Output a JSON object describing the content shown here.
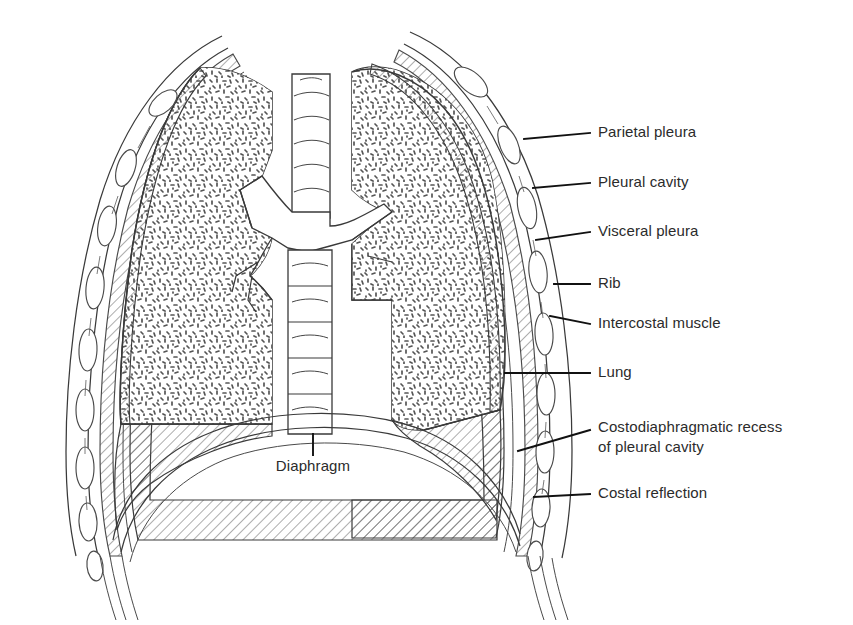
{
  "figure": {
    "background_color": "#ffffff",
    "ink_color": "#3a3a3a",
    "text_color": "#2b2b2b",
    "width": 853,
    "height": 625
  },
  "labels": [
    {
      "id": "parietal-pleura",
      "text": "Parietal pleura",
      "text_x": 598,
      "text_y": 133,
      "leader": {
        "x1": 524,
        "y1": 139,
        "x2": 590,
        "y2": 133
      }
    },
    {
      "id": "pleural-cavity",
      "text": "Pleural cavity",
      "text_x": 598,
      "text_y": 183,
      "leader": {
        "x1": 533,
        "y1": 188,
        "x2": 590,
        "y2": 183
      }
    },
    {
      "id": "visceral-pleura",
      "text": "Visceral pleura",
      "text_x": 598,
      "text_y": 232,
      "leader": {
        "x1": 536,
        "y1": 240,
        "x2": 590,
        "y2": 232
      }
    },
    {
      "id": "rib",
      "text": "Rib",
      "text_x": 598,
      "text_y": 284,
      "leader": {
        "x1": 554,
        "y1": 284,
        "x2": 590,
        "y2": 284
      }
    },
    {
      "id": "intercostal-muscle",
      "text": "Intercostal muscle",
      "text_x": 598,
      "text_y": 324,
      "leader": {
        "x1": 550,
        "y1": 316,
        "x2": 590,
        "y2": 324
      }
    },
    {
      "id": "lung",
      "text": "Lung",
      "text_x": 598,
      "text_y": 373,
      "leader": {
        "x1": 505,
        "y1": 373,
        "x2": 590,
        "y2": 373
      }
    },
    {
      "id": "costal-reflection",
      "text": "Costal reflection",
      "text_x": 598,
      "text_y": 494,
      "leader": {
        "x1": 534,
        "y1": 497,
        "x2": 590,
        "y2": 494
      }
    }
  ],
  "labels_multiline": [
    {
      "id": "costodiaphragmatic-recess",
      "line1": "Costodiaphragmatic recess",
      "line2": "of pleural cavity",
      "text_x": 598,
      "line1_y": 428,
      "line2_y": 448,
      "leader": {
        "x1": 518,
        "y1": 451,
        "x2": 590,
        "y2": 430
      }
    }
  ],
  "labels_inner": [
    {
      "id": "diaphragm",
      "text": "Diaphragm",
      "text_x": 313,
      "text_y": 467,
      "leader": {
        "x1": 313,
        "y1": 434,
        "x2": 313,
        "y2": 455
      }
    }
  ],
  "anatomy_parts": [
    "lung-left",
    "lung-right",
    "parietal-pleura-band-left",
    "parietal-pleura-band-right",
    "pleural-cavity-space",
    "visceral-pleura-line",
    "rib-chain-left",
    "rib-chain-right",
    "intercostal-muscle-lines",
    "trachea",
    "carina",
    "bronchus-left",
    "bronchus-right",
    "vertebral-column",
    "diaphragm-dome",
    "costodiaphragmatic-recess-left",
    "costodiaphragmatic-recess-right",
    "costal-reflection-point"
  ]
}
